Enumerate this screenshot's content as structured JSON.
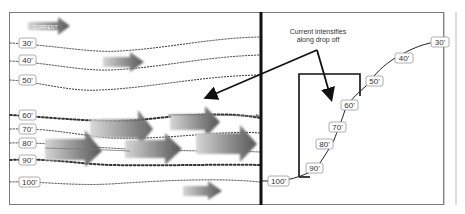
{
  "diagram": {
    "legend": {
      "label": "CURRENT",
      "icon": "gradient-arrow"
    },
    "annotation": {
      "line1": "Current intensifies",
      "line2": "along drop off"
    },
    "plan_view": {
      "depth_labels": [
        "30'",
        "40'",
        "50'",
        "60'",
        "70'",
        "80'",
        "90'",
        "100'"
      ]
    },
    "profile_view": {
      "depth_labels": [
        "30'",
        "40'",
        "50'",
        "60'",
        "70'",
        "80'",
        "90'",
        "100'"
      ]
    },
    "colors": {
      "frame": "#7a7a7a",
      "divider": "#111111",
      "contour": "#333333",
      "arrow_dark": "#5a5a5a",
      "arrow_light": "#d0d0d0"
    }
  }
}
